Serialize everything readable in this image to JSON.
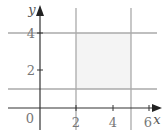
{
  "diagram": {
    "type": "region-on-coordinate-plane",
    "x_axis_label": "x",
    "y_axis_label": "y",
    "origin_label": "0",
    "x_ticks": [
      {
        "value": 2,
        "label": "2"
      },
      {
        "value": 4,
        "label": "4"
      },
      {
        "value": 6,
        "label": "6"
      }
    ],
    "y_ticks": [
      {
        "value": 2,
        "label": "2"
      },
      {
        "value": 4,
        "label": "4"
      }
    ],
    "boundary_lines": [
      {
        "name": "x = 2",
        "orientation": "vertical",
        "value": 2
      },
      {
        "name": "x = 5",
        "orientation": "vertical",
        "value": 5
      },
      {
        "name": "y = 1",
        "orientation": "horizontal",
        "value": 1
      },
      {
        "name": "y = 4",
        "orientation": "horizontal",
        "value": 4
      }
    ],
    "shaded_region": {
      "x_min": 2,
      "x_max": 5,
      "y_min": 1,
      "y_max": 4
    },
    "colors": {
      "axes": "#333333",
      "boundary_lines": "#aaaaaa",
      "shading": "#f4f4f4",
      "labels": "#777777"
    }
  }
}
